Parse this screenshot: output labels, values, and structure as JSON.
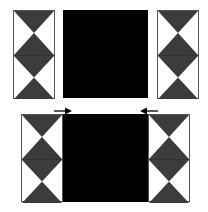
{
  "figure": {
    "colors": {
      "block": "#000000",
      "triangle": "#3c3c3c",
      "background": "#ffffff",
      "border": "#555555"
    },
    "top_row": {
      "left_column": {
        "cells": 2,
        "pattern": "hourglass"
      },
      "center_block": {
        "fill": "black"
      },
      "right_column": {
        "cells": 2,
        "pattern": "hourglass"
      }
    },
    "arrows": [
      {
        "direction": "right",
        "icon": "arrow-right-icon"
      },
      {
        "direction": "left",
        "icon": "arrow-left-icon"
      }
    ],
    "bottom_row": {
      "left_column": {
        "cells": 2,
        "pattern": "hourglass"
      },
      "center_block": {
        "fill": "black"
      },
      "right_column": {
        "cells": 2,
        "pattern": "hourglass"
      }
    }
  }
}
